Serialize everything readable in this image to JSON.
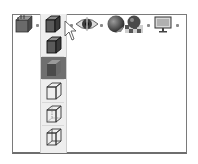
{
  "toolbar": {
    "items": [
      {
        "name": "view-orientation",
        "icon": "view-orientation-icon",
        "has_dropdown": true
      },
      {
        "name": "display-style",
        "icon": "shaded-with-edges-icon",
        "has_dropdown": true,
        "expanded": true
      },
      {
        "name": "hide-show-items",
        "icon": "eye-icon",
        "has_dropdown": true
      },
      {
        "name": "edit-appearance",
        "icon": "appearance-sphere-icon",
        "has_dropdown": true
      },
      {
        "name": "apply-scene",
        "icon": "scene-icon",
        "has_dropdown": true
      },
      {
        "name": "view-settings",
        "icon": "monitor-icon",
        "has_dropdown": true
      }
    ]
  },
  "display_style_flyout": {
    "items": [
      {
        "name": "shaded-with-edges",
        "icon": "shaded-with-edges-icon",
        "selected": false
      },
      {
        "name": "shaded",
        "icon": "shaded-icon",
        "selected": true
      },
      {
        "name": "hidden-lines-removed",
        "icon": "hidden-lines-removed-icon",
        "selected": false
      },
      {
        "name": "hidden-lines-visible",
        "icon": "hidden-lines-visible-icon",
        "selected": false
      },
      {
        "name": "wireframe",
        "icon": "wireframe-icon",
        "selected": false
      }
    ]
  },
  "colors": {
    "panel_border": "#7a7a7a",
    "flyout_bg": "#eeeeee",
    "selected_bg": "#6f6f6f",
    "icon_dark": "#3a3a3a",
    "icon_mid": "#7a7a7a"
  }
}
